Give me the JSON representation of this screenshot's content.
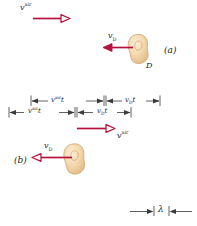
{
  "figure": {
    "colors": {
      "wavefront": "#d4875f",
      "wavefront_light": "#e8b394",
      "source_line": "#8b93ad",
      "arrow": "#b5123e",
      "blob_fill": "#f3d9b0",
      "blob_stroke": "#d2a86f",
      "text": "#221f1f",
      "background": "#ffffff"
    },
    "panels": [
      {
        "id": "a",
        "label": "(a)",
        "air_velocity_label": {
          "symbol": "v",
          "superscript": "air"
        },
        "detector_velocity_label": {
          "symbol": "v",
          "subscript": "D"
        },
        "detector_label": "D",
        "air_arrow_direction": "right",
        "detector_arrow_direction": "left",
        "dimensions": [
          {
            "name": "air-distance",
            "symbol": "v",
            "superscript": "air",
            "suffix": "t"
          },
          {
            "name": "detector-distance",
            "symbol": "v",
            "subscript": "D",
            "suffix": "t"
          }
        ],
        "wavefront_count": 8
      },
      {
        "id": "b",
        "label": "(b)",
        "air_velocity_label": {
          "symbol": "v",
          "superscript": "air"
        },
        "detector_velocity_label": {
          "symbol": "v",
          "subscript": "D"
        },
        "air_arrow_direction": "right",
        "detector_arrow_direction": "left",
        "wavelength_label": "λ",
        "wavefront_count": 8
      }
    ]
  }
}
